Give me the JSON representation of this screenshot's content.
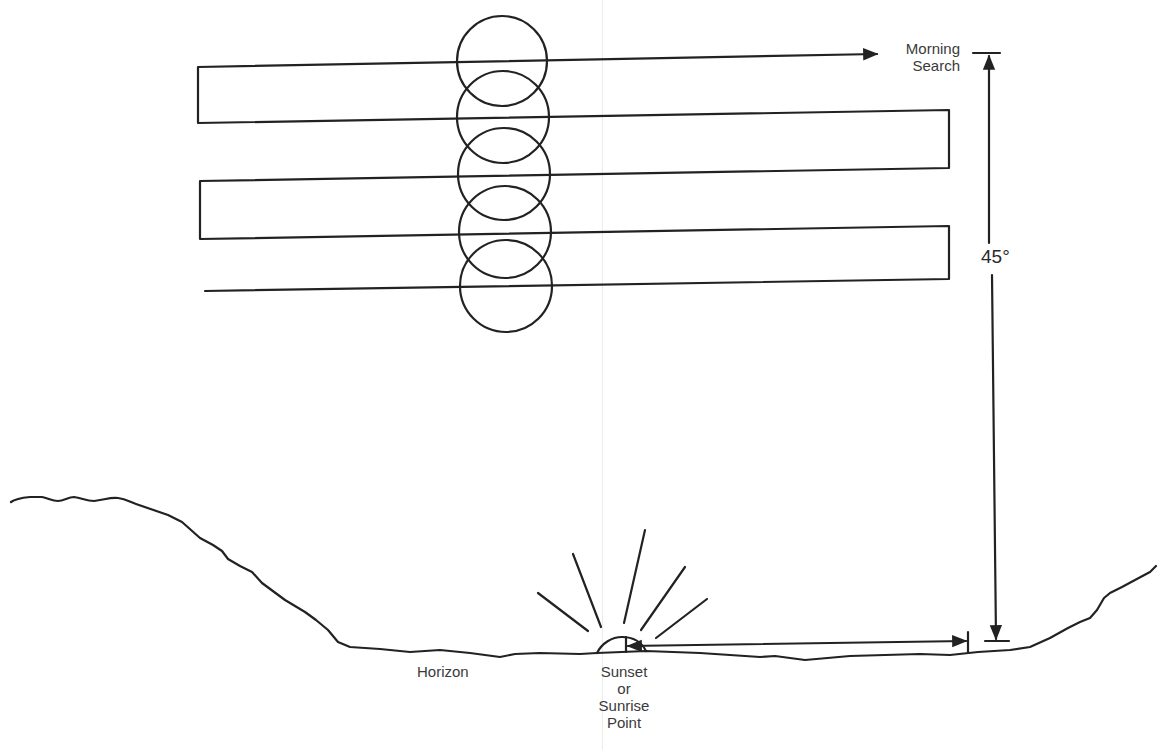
{
  "diagram": {
    "labels": {
      "morning_search": [
        "Morning",
        "Search"
      ],
      "angle": "45°",
      "horizon": "Horizon",
      "sun_point": [
        "Sunset",
        "or",
        "Sunrise",
        "Point"
      ]
    },
    "colors": {
      "ink": "#222222",
      "text": "#3a3a3a",
      "background": "#ffffff"
    },
    "search_path": {
      "description": "Back-and-forth sweep pattern descending from 45° altitude toward the horizon",
      "legs": 5,
      "points": [
        [
          877,
          54
        ],
        [
          198,
          67
        ],
        [
          198,
          123
        ],
        [
          949,
          110
        ],
        [
          949,
          168
        ],
        [
          200,
          181
        ],
        [
          200,
          239
        ],
        [
          949,
          226
        ],
        [
          949,
          279
        ],
        [
          205,
          291
        ]
      ]
    },
    "scan_circles": [
      {
        "cx": 502,
        "cy": 61,
        "r": 45
      },
      {
        "cx": 503,
        "cy": 117,
        "r": 46
      },
      {
        "cx": 504,
        "cy": 174,
        "r": 46
      },
      {
        "cx": 505,
        "cy": 232,
        "r": 46
      },
      {
        "cx": 506,
        "cy": 286,
        "r": 46
      }
    ],
    "dimension": {
      "angle_label": "45°",
      "from": "sunset or sunrise point",
      "to": "morning search start"
    },
    "sun_rays": 5
  }
}
